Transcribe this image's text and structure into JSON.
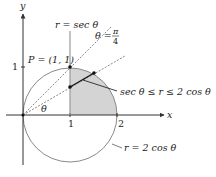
{
  "axes": {
    "x_label": "x",
    "y_label": "y",
    "x_ticks": [
      "1",
      "2"
    ],
    "y_ticks": [
      "1"
    ]
  },
  "labels": {
    "sec_line": "r = sec θ",
    "theta_line_prefix": "θ =",
    "theta_line_num": "π",
    "theta_line_den": "4",
    "point": "P = (1, 1)",
    "region": "sec θ ≤ r ≤ 2 cos  θ",
    "circle": "r = 2 cos θ",
    "angle": "θ"
  },
  "colors": {
    "shade": "#d4d4d4",
    "circle": "#8a8a8a",
    "axis": "#333333",
    "ink": "#111111"
  }
}
